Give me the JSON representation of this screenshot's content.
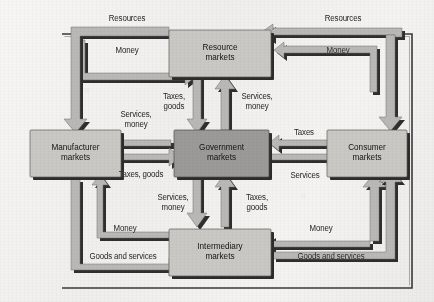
{
  "figure": {
    "type": "flow-diagram",
    "background_color": "#f1f0ee",
    "frame_color": "#3a3a3a",
    "arrow_fill": "#b7b7b5",
    "arrow_shadow": "#2b2b2b",
    "box_fill": "#c9c8c5",
    "center_box_fill": "#9a9997"
  },
  "boxes": [
    {
      "id": "resource",
      "line1": "Resource",
      "line2": "markets"
    },
    {
      "id": "manufacturer",
      "line1": "Manufacturer",
      "line2": "markets"
    },
    {
      "id": "government",
      "line1": "Government",
      "line2": "markets"
    },
    {
      "id": "consumer",
      "line1": "Consumer",
      "line2": "markets"
    },
    {
      "id": "intermediary",
      "line1": "Intermediary",
      "line2": "markets"
    }
  ],
  "labels": {
    "top_left_resources": "Resources",
    "top_left_money": "Money",
    "top_right_resources": "Resources",
    "top_right_money": "Money",
    "center_top_taxes_goods": "Taxes,\ngoods",
    "center_top_services_money": "Services,\nmoney",
    "left_services_money": "Services,\nmoney",
    "left_taxes_goods": "Taxes, goods",
    "right_taxes": "Taxes",
    "right_services": "Services",
    "center_bottom_services_money": "Services,\nmoney",
    "center_bottom_taxes_goods": "Taxes,\ngoods",
    "bottom_left_money": "Money",
    "bottom_left_goods_services": "Goods and services",
    "bottom_right_money": "Money",
    "bottom_right_goods_services": "Goods and services"
  },
  "flows": [
    {
      "from": "manufacturer",
      "to": "resource",
      "label": "Money"
    },
    {
      "from": "resource",
      "to": "manufacturer",
      "label": "Resources"
    },
    {
      "from": "consumer",
      "to": "resource",
      "label": "Money"
    },
    {
      "from": "resource",
      "to": "consumer",
      "label": "Resources"
    },
    {
      "from": "resource",
      "to": "government",
      "label": "Taxes, goods"
    },
    {
      "from": "government",
      "to": "resource",
      "label": "Services, money"
    },
    {
      "from": "government",
      "to": "manufacturer",
      "label": "Services, money"
    },
    {
      "from": "manufacturer",
      "to": "government",
      "label": "Taxes, goods"
    },
    {
      "from": "government",
      "to": "consumer",
      "label": "Services"
    },
    {
      "from": "consumer",
      "to": "government",
      "label": "Taxes"
    },
    {
      "from": "government",
      "to": "intermediary",
      "label": "Services, money"
    },
    {
      "from": "intermediary",
      "to": "government",
      "label": "Taxes, goods"
    },
    {
      "from": "manufacturer",
      "to": "intermediary",
      "label": "Goods and services"
    },
    {
      "from": "intermediary",
      "to": "manufacturer",
      "label": "Money"
    },
    {
      "from": "intermediary",
      "to": "consumer",
      "label": "Goods and services"
    },
    {
      "from": "consumer",
      "to": "intermediary",
      "label": "Money"
    }
  ]
}
